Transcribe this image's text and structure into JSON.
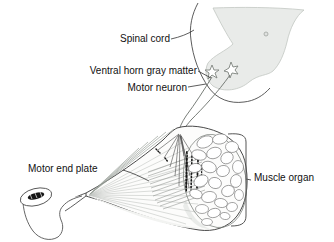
{
  "figure": {
    "labels": {
      "spinal_cord": "Spinal cord",
      "ventral_horn": "Ventral horn gray matter",
      "motor_neuron": "Motor neuron",
      "motor_end_plate": "Motor end plate",
      "muscle_organ": "Muscle organ"
    },
    "colors": {
      "background": "#ffffff",
      "cord_gray_matter_fill": "#e9ebe9",
      "outline": "#4a4a4a",
      "text": "#111111",
      "end_plate_dots": "#161616"
    }
  }
}
